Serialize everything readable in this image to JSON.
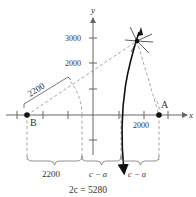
{
  "diagram": {
    "axes": {
      "x_label": "x",
      "y_label": "y",
      "y_tick_labels": [
        "3000",
        "2000"
      ],
      "x_tick_label": "2000"
    },
    "points": {
      "A": "A",
      "B": "B"
    },
    "dimension_labels": {
      "distance_to_B": "2200",
      "bottom_segment_1": "2200",
      "bottom_segment_2": "c − a",
      "bottom_segment_3": "c − a"
    },
    "equation": "2c = 5280",
    "colors": {
      "curve": "#111111",
      "axes": "#555555",
      "dashed": "#888888",
      "text": "#333333"
    }
  }
}
